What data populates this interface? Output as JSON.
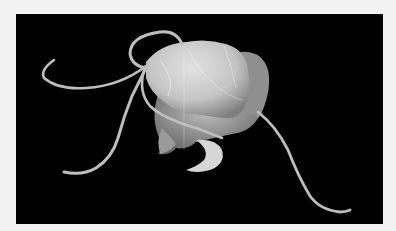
{
  "image": {
    "description": "Scanning electron micrograph of a flagellated protist cell on a black background",
    "subject": "flagellated single-celled organism",
    "flagella_count": 4,
    "colors": {
      "border": "#f2f2f2",
      "background": "#000000",
      "cell": "#cfcfcf",
      "cell_shadow": "#8a8a8a",
      "flagellum": "#bdbdbd"
    }
  }
}
